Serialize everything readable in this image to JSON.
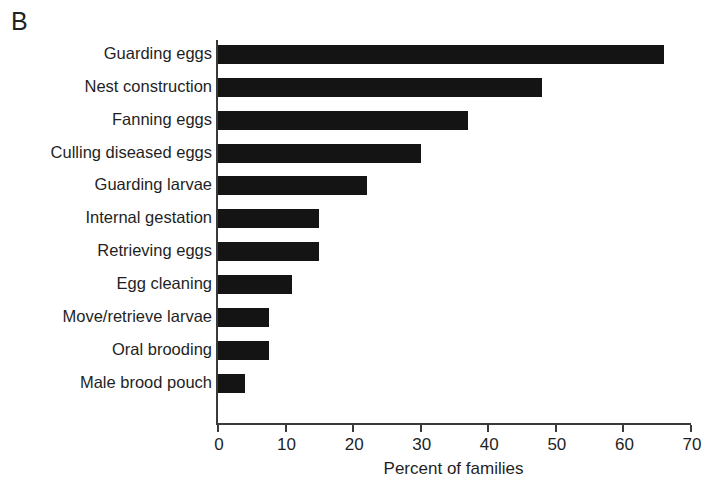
{
  "panel": {
    "letter": "B"
  },
  "chart_data": {
    "type": "bar",
    "orientation": "horizontal",
    "title": "",
    "subtitle": "",
    "xlabel": "Percent of families",
    "ylabel": "",
    "xlim": [
      0,
      70
    ],
    "xticks": [
      0,
      10,
      20,
      30,
      40,
      50,
      60,
      70
    ],
    "xtick_labels": [
      "0",
      "10",
      "20",
      "30",
      "40",
      "50",
      "60",
      "70"
    ],
    "grid": false,
    "legend": null,
    "bar_color": "#141414",
    "axis_color": "#3a3a3a",
    "categories": [
      "Guarding eggs",
      "Nest construction",
      "Fanning eggs",
      "Culling diseased eggs",
      "Guarding larvae",
      "Internal gestation",
      "Retrieving eggs",
      "Egg cleaning",
      "Move/retrieve larvae",
      "Oral brooding",
      "Male brood pouch"
    ],
    "values": [
      66,
      48,
      37,
      30,
      22,
      15,
      15,
      11,
      7.5,
      7.5,
      4
    ]
  }
}
